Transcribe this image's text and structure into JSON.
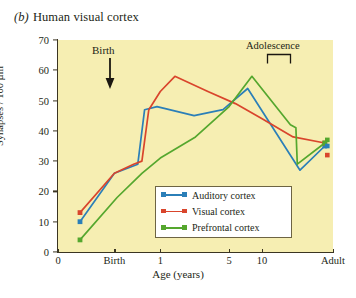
{
  "figure": {
    "panel_letter": "(b)",
    "panel_title": "Human visual cortex"
  },
  "annotations": {
    "birth": "Birth",
    "adolescence": "Adolescence"
  },
  "legend": [
    {
      "label": "Auditory cortex",
      "color": "#2b7fb8"
    },
    {
      "label": "Visual cortex",
      "color": "#d9452c"
    },
    {
      "label": "Prefrontal cortex",
      "color": "#55a72e"
    }
  ],
  "chart_data": {
    "type": "line",
    "title": "Human visual cortex",
    "xlabel": "Age (years)",
    "ylabel": "Synapses / 100 µm³",
    "ylim": [
      0,
      70
    ],
    "yticks": [
      0,
      10,
      20,
      30,
      40,
      50,
      60,
      70
    ],
    "xticks": [
      "0",
      "Birth",
      "1",
      "5",
      "10",
      "Adult"
    ],
    "xtick_positions": [
      0.0,
      20.5,
      37.2,
      62.2,
      74.2,
      100.0
    ],
    "grid": false,
    "legend_position": "inside-bottom-center",
    "background": "#f6eeb2",
    "series": [
      {
        "name": "Auditory cortex",
        "color": "#2b7fb8",
        "points": [
          {
            "x_label": "prenatal",
            "x_pct": 8.0,
            "value": 10
          },
          {
            "x_label": "Birth",
            "x_pct": 20.5,
            "value": 26
          },
          {
            "x_label": "0.35",
            "x_pct": 29.0,
            "value": 29
          },
          {
            "x_label": "0.55",
            "x_pct": 31.5,
            "value": 47
          },
          {
            "x_label": "0.9",
            "x_pct": 36.0,
            "value": 48
          },
          {
            "x_label": "2",
            "x_pct": 49.5,
            "value": 45
          },
          {
            "x_label": "4",
            "x_pct": 60.0,
            "value": 47
          },
          {
            "x_label": "8",
            "x_pct": 69.0,
            "value": 54
          },
          {
            "x_label": "15",
            "x_pct": 88.0,
            "value": 27
          },
          {
            "x_label": "Adult",
            "x_pct": 97.0,
            "value": 35
          }
        ]
      },
      {
        "name": "Visual cortex",
        "color": "#d9452c",
        "points": [
          {
            "x_label": "prenatal",
            "x_pct": 8.0,
            "value": 13
          },
          {
            "x_label": "Birth",
            "x_pct": 20.5,
            "value": 26
          },
          {
            "x_label": "0.3",
            "x_pct": 27.5,
            "value": 29
          },
          {
            "x_label": "0.5",
            "x_pct": 30.5,
            "value": 30
          },
          {
            "x_label": "0.7",
            "x_pct": 33.0,
            "value": 47
          },
          {
            "x_label": "1",
            "x_pct": 37.2,
            "value": 53
          },
          {
            "x_label": "1.6",
            "x_pct": 42.5,
            "value": 58
          },
          {
            "x_label": "3",
            "x_pct": 54.5,
            "value": 53
          },
          {
            "x_label": "6",
            "x_pct": 64.5,
            "value": 49
          },
          {
            "x_label": "10",
            "x_pct": 74.2,
            "value": 44
          },
          {
            "x_label": "14",
            "x_pct": 85.5,
            "value": 38
          },
          {
            "x_label": "Adult",
            "x_pct": 97.0,
            "value": 36
          }
        ]
      },
      {
        "name": "Prefrontal cortex",
        "color": "#55a72e",
        "points": [
          {
            "x_label": "prenatal",
            "x_pct": 8.0,
            "value": 4
          },
          {
            "x_label": "Birth",
            "x_pct": 21.5,
            "value": 18
          },
          {
            "x_label": "0.5",
            "x_pct": 30.5,
            "value": 26
          },
          {
            "x_label": "1",
            "x_pct": 37.2,
            "value": 31
          },
          {
            "x_label": "2.5",
            "x_pct": 50.0,
            "value": 38
          },
          {
            "x_label": "5",
            "x_pct": 62.2,
            "value": 48
          },
          {
            "x_label": "8",
            "x_pct": 70.5,
            "value": 58
          },
          {
            "x_label": "14",
            "x_pct": 84.5,
            "value": 42
          },
          {
            "x_label": "16",
            "x_pct": 86.5,
            "value": 41
          },
          {
            "x_label": "17",
            "x_pct": 87.0,
            "value": 29
          },
          {
            "x_label": "Adult",
            "x_pct": 97.0,
            "value": 36
          }
        ]
      }
    ],
    "adult_markers": [
      {
        "name": "Prefrontal cortex",
        "color": "#55a72e",
        "value": 37
      },
      {
        "name": "Auditory cortex",
        "color": "#2b7fb8",
        "value": 35
      },
      {
        "name": "Visual cortex",
        "color": "#d9452c",
        "value": 32
      }
    ]
  }
}
